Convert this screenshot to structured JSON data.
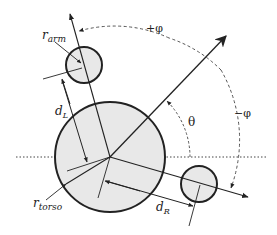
{
  "diagram": {
    "type": "geometry-schematic",
    "colors": {
      "background": "#ffffff",
      "circle_fill": "#e8e8e8",
      "stroke": "#222222",
      "dashed": "#555555"
    },
    "labels": {
      "r_arm": {
        "base": "r",
        "sub": "arm"
      },
      "d_L": {
        "base": "d",
        "sub": "L"
      },
      "r_torso": {
        "base": "r",
        "sub": "torso"
      },
      "d_R": {
        "base": "d",
        "sub": "R"
      },
      "theta": "θ",
      "plus_phi": "+φ",
      "minus_phi": "−φ"
    },
    "shapes": {
      "torso": {
        "cx": 110,
        "cy": 157,
        "r": 55
      },
      "left_arm": {
        "cx": 84,
        "cy": 65,
        "r": 18
      },
      "right_arm": {
        "cx": 199,
        "cy": 184,
        "r": 18
      }
    }
  }
}
